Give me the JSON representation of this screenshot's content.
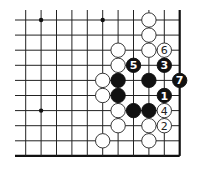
{
  "board": {
    "columns": 11,
    "rows": 10,
    "origin_x": 25.7,
    "origin_y": 20,
    "spacing_x": 15.4,
    "spacing_y": 15.1,
    "stone_radius": 7.2,
    "line_extend_left": 15,
    "line_extend_top": 10,
    "edges": [
      "right",
      "bottom"
    ],
    "star_points": [
      {
        "col": 1,
        "row": 0
      },
      {
        "col": 5,
        "row": 0
      },
      {
        "col": 1,
        "row": 6
      }
    ],
    "stones": [
      {
        "color": "white",
        "col": 8,
        "row": 0,
        "label": ""
      },
      {
        "color": "white",
        "col": 8,
        "row": 1,
        "label": ""
      },
      {
        "color": "white",
        "col": 6,
        "row": 2,
        "label": ""
      },
      {
        "color": "white",
        "col": 8,
        "row": 2,
        "label": ""
      },
      {
        "color": "white",
        "col": 9,
        "row": 2,
        "label": "6"
      },
      {
        "color": "white",
        "col": 6,
        "row": 3,
        "label": ""
      },
      {
        "color": "black",
        "col": 7,
        "row": 3,
        "label": "5"
      },
      {
        "color": "black",
        "col": 9,
        "row": 3,
        "label": "3"
      },
      {
        "color": "white",
        "col": 5,
        "row": 4,
        "label": ""
      },
      {
        "color": "black",
        "col": 6,
        "row": 4,
        "label": ""
      },
      {
        "color": "black",
        "col": 8,
        "row": 4,
        "label": ""
      },
      {
        "color": "black",
        "col": 10,
        "row": 4,
        "label": "7"
      },
      {
        "color": "white",
        "col": 5,
        "row": 5,
        "label": ""
      },
      {
        "color": "black",
        "col": 6,
        "row": 5,
        "label": ""
      },
      {
        "color": "black",
        "col": 9,
        "row": 5,
        "label": "1"
      },
      {
        "color": "white",
        "col": 6,
        "row": 6,
        "label": ""
      },
      {
        "color": "black",
        "col": 7,
        "row": 6,
        "label": ""
      },
      {
        "color": "black",
        "col": 8,
        "row": 6,
        "label": ""
      },
      {
        "color": "white",
        "col": 9,
        "row": 6,
        "label": "4"
      },
      {
        "color": "white",
        "col": 6,
        "row": 7,
        "label": ""
      },
      {
        "color": "white",
        "col": 8,
        "row": 7,
        "label": ""
      },
      {
        "color": "white",
        "col": 9,
        "row": 7,
        "label": "2"
      },
      {
        "color": "white",
        "col": 5,
        "row": 8,
        "label": ""
      },
      {
        "color": "white",
        "col": 8,
        "row": 8,
        "label": ""
      }
    ]
  },
  "colors": {
    "line": "#222222",
    "black_stone": "#111111",
    "white_stone": "#ffffff",
    "background": "#ffffff"
  }
}
